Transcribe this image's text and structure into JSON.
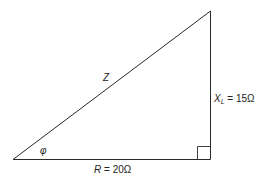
{
  "diagram": {
    "type": "impedance-triangle",
    "labels": {
      "hypotenuse": "Z",
      "angle": "φ",
      "base_symbol": "R",
      "base_value": " = 20Ω",
      "vertical_symbol": "X",
      "vertical_subscript": "L",
      "vertical_value": " = 15Ω"
    },
    "values": {
      "resistance_ohms": 20,
      "inductive_reactance_ohms": 15
    },
    "colors": {
      "line": "#2a2a2a",
      "text": "#222222",
      "background": "#ffffff"
    }
  }
}
